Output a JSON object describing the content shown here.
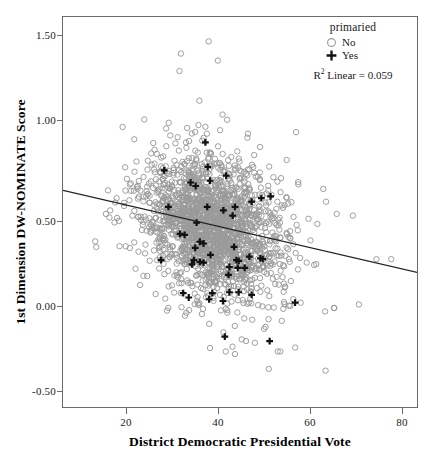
{
  "chart_data": {
    "type": "scatter",
    "title": "",
    "xlabel": "District Democratic Presidential Vote",
    "ylabel": "1st Dimension DW-NOMINATE Score",
    "xlim": [
      7,
      84
    ],
    "ylim": [
      -0.63,
      1.62
    ],
    "xticks": [
      20,
      40,
      60,
      80
    ],
    "xtick_labels": [
      "20",
      "40",
      "60",
      "80"
    ],
    "yticks": [
      1.5,
      1.0,
      0.5,
      0.0,
      -0.5
    ],
    "ytick_labels": [
      "1.50",
      "1.00",
      "0.50",
      "0.00",
      "-0.50"
    ],
    "grid": false,
    "legend": {
      "title": "primaried",
      "position": "top-right",
      "entries": [
        {
          "label": "No",
          "marker": "open-circle",
          "color": "#9a9a9a"
        },
        {
          "label": "Yes",
          "marker": "plus",
          "color": "#111111"
        }
      ]
    },
    "annotations": [
      {
        "text_prefix": "R",
        "text_sup": "2",
        "text": " Linear = 0.059",
        "full": "R² Linear = 0.059"
      }
    ],
    "fit_line": {
      "type": "linear",
      "r_squared": 0.059,
      "intercept": 0.668,
      "slope": -0.00615,
      "endpoints": [
        {
          "x": 7,
          "y": 0.625
        },
        {
          "x": 84,
          "y": 0.152
        }
      ],
      "color": "#222222"
    },
    "series": [
      {
        "name": "No",
        "marker": "open-circle",
        "color": "#9a9a9a",
        "n_approx": 1900,
        "comment": "dense cloud, x 18-80, y -0.45 to 1.50, centered near x=40 y=0.42",
        "cloud": {
          "x_center": 39.5,
          "y_center": 0.415,
          "x_sd": 7.6,
          "y_sd": 0.2,
          "x_min": 13.5,
          "x_max": 79.5,
          "y_min": -0.46,
          "y_max": 1.49,
          "corr": -0.24
        },
        "outliers": [
          [
            32.5,
            1.41
          ],
          [
            38.5,
            1.48
          ],
          [
            40.5,
            1.37
          ],
          [
            32.2,
            1.31
          ],
          [
            36.5,
            1.14
          ],
          [
            41.5,
            1.06
          ],
          [
            42.5,
            1.03
          ],
          [
            36.3,
            1.0
          ],
          [
            37.8,
            0.99
          ],
          [
            29.3,
            0.98
          ],
          [
            35.6,
            0.96
          ],
          [
            47.0,
            0.95
          ],
          [
            30.2,
            0.94
          ],
          [
            31.8,
            0.93
          ],
          [
            33.6,
            0.9
          ],
          [
            14.2,
            0.3
          ],
          [
            18.6,
            0.58
          ],
          [
            19.1,
            0.45
          ],
          [
            17.2,
            0.51
          ],
          [
            69.7,
            0.48
          ],
          [
            63.9,
            0.56
          ],
          [
            66.2,
            0.49
          ],
          [
            74.8,
            0.23
          ],
          [
            78.0,
            0.23
          ],
          [
            71.0,
            -0.03
          ],
          [
            65.6,
            -0.05
          ],
          [
            63.7,
            -0.07
          ],
          [
            51.5,
            -0.4
          ],
          [
            63.8,
            -0.41
          ],
          [
            42.2,
            -0.3
          ],
          [
            38.8,
            -0.28
          ],
          [
            54.0,
            -0.3
          ],
          [
            46.6,
            -0.24
          ],
          [
            48.5,
            -0.25
          ],
          [
            50.5,
            -0.17
          ],
          [
            41.7,
            -0.19
          ],
          [
            56.8,
            0.0
          ],
          [
            58.4,
            -0.02
          ]
        ]
      },
      {
        "name": "Yes",
        "marker": "plus",
        "color": "#111111",
        "n_approx": 62,
        "points": [
          [
            37.8,
            0.9
          ],
          [
            38.3,
            0.76
          ],
          [
            28.9,
            0.74
          ],
          [
            42.3,
            0.71
          ],
          [
            38.8,
            0.68
          ],
          [
            34.6,
            0.67
          ],
          [
            35.7,
            0.65
          ],
          [
            51.9,
            0.59
          ],
          [
            49.9,
            0.58
          ],
          [
            44.2,
            0.53
          ],
          [
            38.2,
            0.53
          ],
          [
            29.8,
            0.53
          ],
          [
            47.8,
            0.56
          ],
          [
            41.7,
            0.51
          ],
          [
            43.7,
            0.48
          ],
          [
            35.9,
            0.44
          ],
          [
            32.3,
            0.375
          ],
          [
            33.3,
            0.37
          ],
          [
            36.6,
            0.33
          ],
          [
            37.4,
            0.32
          ],
          [
            35.6,
            0.295
          ],
          [
            44.0,
            0.3
          ],
          [
            38.9,
            0.255
          ],
          [
            47.3,
            0.245
          ],
          [
            49.7,
            0.235
          ],
          [
            50.2,
            0.23
          ],
          [
            35.3,
            0.225
          ],
          [
            44.5,
            0.225
          ],
          [
            45.0,
            0.22
          ],
          [
            36.6,
            0.215
          ],
          [
            37.4,
            0.21
          ],
          [
            34.9,
            0.2
          ],
          [
            28.2,
            0.225
          ],
          [
            43.0,
            0.185
          ],
          [
            44.8,
            0.18
          ],
          [
            46.3,
            0.18
          ],
          [
            42.8,
            0.14
          ],
          [
            33.0,
            0.035
          ],
          [
            43.0,
            0.04
          ],
          [
            45.0,
            0.04
          ],
          [
            39.3,
            0.035
          ],
          [
            47.8,
            0.025
          ],
          [
            34.2,
            0.01
          ],
          [
            41.6,
            -0.01
          ],
          [
            38.6,
            0.0
          ],
          [
            42.0,
            -0.215
          ],
          [
            51.7,
            -0.24
          ],
          [
            57.2,
            -0.02
          ]
        ]
      }
    ]
  },
  "axes": {
    "y_axis_label": "1st Dimension DW-NOMINATE Score",
    "x_axis_label": "District Democratic Presidential Vote"
  },
  "legend": {
    "title": "primaried",
    "no_label": "No",
    "yes_label": "Yes",
    "r2_prefix": "R",
    "r2_sup": "2",
    "r2_text": " Linear = 0.059"
  },
  "colors": {
    "frame": "#6b6b6b",
    "point_no": "#9a9a9a",
    "point_yes": "#111111",
    "fit_line": "#222222",
    "text": "#1a1a1a",
    "background": "#ffffff"
  }
}
